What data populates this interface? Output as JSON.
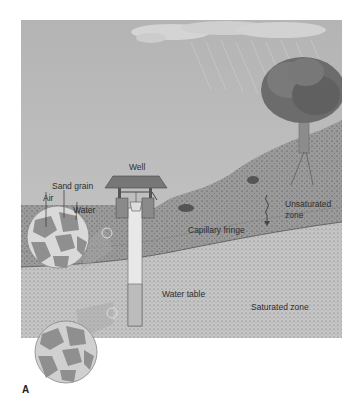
{
  "figure": {
    "letter": "A",
    "labels": {
      "well": "Well",
      "sand_grain": "Sand grain",
      "air": "Air",
      "water": "Water",
      "unsaturated_zone_line1": "Unsaturated",
      "unsaturated_zone_line2": "zone",
      "capillary_fringe": "Capillary fringe",
      "water_table": "Water table",
      "saturated_zone": "Saturated zone"
    },
    "colors": {
      "sky": "#b9b9b9",
      "unsaturated": "#9a9a9a",
      "saturated": "#c4c4c4",
      "grain": "#8f8f8f",
      "pore_water": "#d9d9d9",
      "background": "#ffffff"
    }
  }
}
